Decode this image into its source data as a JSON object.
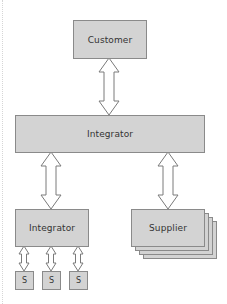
{
  "diagram": {
    "nodes": {
      "customer": {
        "label": "Customer"
      },
      "integrator_main": {
        "label": "Integrator"
      },
      "integrator_sub": {
        "label": "Integrator"
      },
      "supplier": {
        "label": "Supplier",
        "stacked": true,
        "stack_count": 4
      },
      "s1": {
        "label": "S"
      },
      "s2": {
        "label": "S"
      },
      "s3": {
        "label": "S"
      }
    },
    "edges": [
      {
        "from": "customer",
        "to": "integrator_main",
        "type": "bidirectional"
      },
      {
        "from": "integrator_main",
        "to": "integrator_sub",
        "type": "bidirectional"
      },
      {
        "from": "integrator_main",
        "to": "supplier",
        "type": "bidirectional"
      },
      {
        "from": "integrator_sub",
        "to": "s1",
        "type": "bidirectional"
      },
      {
        "from": "integrator_sub",
        "to": "s2",
        "type": "bidirectional"
      },
      {
        "from": "integrator_sub",
        "to": "s3",
        "type": "bidirectional"
      }
    ],
    "colors": {
      "box_fill": "#d3d3d3",
      "box_border": "#8a8a8a",
      "text": "#333333",
      "arrow_fill": "#ffffff",
      "arrow_stroke": "#7a7a7a"
    }
  }
}
